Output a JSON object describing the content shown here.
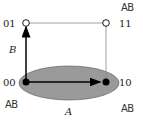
{
  "diagram": {
    "nodes": [
      {
        "id": "00",
        "label": "00",
        "filled": true
      },
      {
        "id": "01",
        "label": "01",
        "filled": false
      },
      {
        "id": "10",
        "label": "10",
        "filled": true
      },
      {
        "id": "11",
        "label": "11",
        "filled": false
      }
    ],
    "axes": {
      "horizontal_label": "A",
      "vertical_label": "B"
    },
    "handwritten_labels": {
      "top_right": "AB",
      "bottom_left": "AB",
      "bottom_right": "AB"
    },
    "colors": {
      "ellipse_fill": "#9a9a9a",
      "stroke": "#000000",
      "edge": "#888888"
    }
  }
}
